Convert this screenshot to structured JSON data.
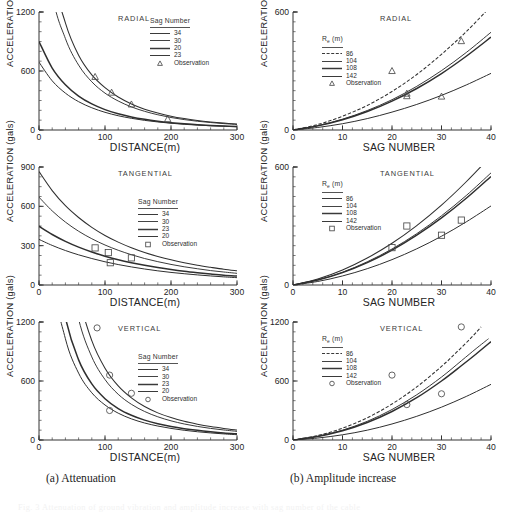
{
  "figure": {
    "subcaption_a": "(a) Attenuation",
    "subcaption_b": "(b) Amplitude increase",
    "ghost_caption": "Fig. 3  Attenuation of ground vibration and amplitude increase with sag number of the cable"
  },
  "axes": {
    "y_title": "ACCELERATION (gals)",
    "x_title_left": "DISTANCE(m)",
    "x_title_right": "SAG NUMBER"
  },
  "legend_labels": {
    "sag_title": "Sag Number",
    "re_title": "R",
    "re_sub": "e",
    "re_unit": " (m)",
    "observation": "Observation"
  },
  "chart_data": [
    {
      "id": "left-radial",
      "type": "line",
      "panel": "RADIAL",
      "column": "(a) Attenuation",
      "title": "RADIAL",
      "xlabel": "DISTANCE(m)",
      "ylabel": "ACCELERATION (gals)",
      "xlim": [
        0,
        300
      ],
      "ylim": [
        0,
        1200
      ],
      "xticks": [
        0,
        100,
        200,
        300
      ],
      "yticks": [
        0,
        600,
        1200
      ],
      "grid": false,
      "legend_title": "Sag Number",
      "legend_position": "top-right",
      "series": [
        {
          "name": "34",
          "x": [
            0,
            20,
            40,
            60,
            80,
            100,
            120,
            140,
            160,
            180,
            200,
            220,
            240,
            260,
            280,
            300
          ],
          "values": [
            3100,
            1660,
            1090,
            760,
            560,
            430,
            335,
            265,
            212,
            172,
            140,
            116,
            97,
            82,
            70,
            60
          ]
        },
        {
          "name": "30",
          "x": [
            0,
            20,
            40,
            60,
            80,
            100,
            120,
            140,
            160,
            180,
            200,
            220,
            240,
            260,
            280,
            300
          ],
          "values": [
            2500,
            1390,
            930,
            660,
            490,
            375,
            295,
            235,
            190,
            155,
            127,
            106,
            89,
            76,
            65,
            56
          ]
        },
        {
          "name": "20",
          "x": [
            0,
            20,
            40,
            60,
            80,
            100,
            120,
            140,
            160,
            180,
            200,
            220,
            240,
            260,
            280,
            300
          ],
          "values": [
            900,
            630,
            460,
            345,
            265,
            207,
            165,
            133,
            109,
            90,
            75,
            63,
            54,
            46,
            40,
            35
          ]
        },
        {
          "name": "23",
          "x": [
            0,
            20,
            40,
            60,
            80,
            100,
            120,
            140,
            160,
            180,
            200,
            220,
            240,
            260,
            280,
            300
          ],
          "values": [
            690,
            500,
            375,
            288,
            226,
            180,
            145,
            119,
            98,
            82,
            69,
            58,
            50,
            43,
            38,
            33
          ]
        }
      ],
      "observations": {
        "name": "Observation",
        "marker": "triangle",
        "points": [
          [
            85,
            540
          ],
          [
            110,
            380
          ],
          [
            140,
            260
          ],
          [
            195,
            110
          ]
        ]
      }
    },
    {
      "id": "left-tangential",
      "type": "line",
      "panel": "TANGENTIAL",
      "column": "(a) Attenuation",
      "title": "TANGENTIAL",
      "xlabel": "DISTANCE(m)",
      "ylabel": "ACCELERATION (gals)",
      "xlim": [
        0,
        300
      ],
      "ylim": [
        0,
        900
      ],
      "xticks": [
        0,
        100,
        200,
        300
      ],
      "yticks": [
        0,
        300,
        600,
        900
      ],
      "grid": false,
      "legend_title": "Sag Number",
      "legend_position": "mid-right",
      "series": [
        {
          "name": "34",
          "x": [
            0,
            20,
            40,
            60,
            80,
            100,
            120,
            140,
            160,
            180,
            200,
            220,
            240,
            260,
            280,
            300
          ],
          "values": [
            865,
            720,
            605,
            515,
            440,
            378,
            327,
            284,
            248,
            218,
            192,
            170,
            151,
            135,
            120,
            108
          ]
        },
        {
          "name": "30",
          "x": [
            0,
            20,
            40,
            60,
            80,
            100,
            120,
            140,
            160,
            180,
            200,
            220,
            240,
            260,
            280,
            300
          ],
          "values": [
            670,
            565,
            480,
            410,
            353,
            305,
            265,
            231,
            202,
            178,
            157,
            139,
            124,
            110,
            99,
            89
          ]
        },
        {
          "name": "23",
          "x": [
            0,
            20,
            40,
            60,
            80,
            100,
            120,
            140,
            160,
            180,
            200,
            220,
            240,
            260,
            280,
            300
          ],
          "values": [
            448,
            385,
            333,
            289,
            252,
            220,
            193,
            170,
            150,
            133,
            118,
            105,
            94,
            84,
            75,
            68
          ]
        },
        {
          "name": "20",
          "x": [
            0,
            20,
            40,
            60,
            80,
            100,
            120,
            140,
            160,
            180,
            200,
            220,
            240,
            260,
            280,
            300
          ],
          "values": [
            348,
            302,
            263,
            230,
            202,
            177,
            156,
            138,
            122,
            108,
            96,
            86,
            77,
            69,
            62,
            56
          ]
        }
      ],
      "observations": {
        "name": "Observation",
        "marker": "square",
        "points": [
          [
            85,
            283
          ],
          [
            105,
            247
          ],
          [
            108,
            170
          ],
          [
            140,
            207
          ]
        ]
      }
    },
    {
      "id": "left-vertical",
      "type": "line",
      "panel": "VERTICAL",
      "column": "(a) Attenuation",
      "title": "VERTICAL",
      "xlabel": "DISTANCE(m)",
      "ylabel": "ACCELERATION (gals)",
      "xlim": [
        0,
        300
      ],
      "ylim": [
        0,
        1200
      ],
      "xticks": [
        0,
        100,
        200,
        300
      ],
      "yticks": [
        0,
        600,
        1200
      ],
      "grid": false,
      "legend_title": "Sag Number",
      "legend_position": "mid-right",
      "series": [
        {
          "name": "34",
          "x": [
            0,
            20,
            40,
            60,
            80,
            100,
            120,
            140,
            160,
            180,
            200,
            220,
            240,
            260,
            280,
            300
          ],
          "values": [
            9000,
            4200,
            2350,
            1480,
            1010,
            730,
            550,
            428,
            340,
            276,
            228,
            190,
            161,
            137,
            118,
            102
          ]
        },
        {
          "name": "30",
          "x": [
            0,
            20,
            40,
            60,
            80,
            100,
            120,
            140,
            160,
            180,
            200,
            220,
            240,
            260,
            280,
            300
          ],
          "values": [
            7200,
            3400,
            1930,
            1230,
            845,
            615,
            465,
            363,
            290,
            236,
            195,
            163,
            138,
            118,
            102,
            88
          ]
        },
        {
          "name": "23",
          "x": [
            0,
            20,
            40,
            60,
            80,
            100,
            120,
            140,
            160,
            180,
            200,
            220,
            240,
            260,
            280,
            300
          ],
          "values": [
            4300,
            2120,
            1250,
            815,
            570,
            420,
            320,
            252,
            202,
            165,
            137,
            115,
            98,
            84,
            72,
            63
          ]
        },
        {
          "name": "20",
          "x": [
            0,
            20,
            40,
            60,
            80,
            100,
            120,
            140,
            160,
            180,
            200,
            220,
            240,
            260,
            280,
            300
          ],
          "values": [
            3400,
            1720,
            1030,
            680,
            480,
            356,
            273,
            215,
            173,
            142,
            118,
            99,
            84,
            72,
            62,
            54
          ]
        }
      ],
      "observations": {
        "name": "Observation",
        "marker": "circle",
        "points": [
          [
            88,
            1140
          ],
          [
            107,
            660
          ],
          [
            107,
            300
          ],
          [
            140,
            475
          ]
        ]
      }
    },
    {
      "id": "right-radial",
      "type": "line",
      "panel": "RADIAL",
      "column": "(b) Amplitude increase",
      "title": "RADIAL",
      "xlabel": "SAG NUMBER",
      "ylabel": "ACCELERATION (gals)",
      "xlim": [
        0,
        40
      ],
      "ylim": [
        0,
        600
      ],
      "xticks": [
        0,
        10,
        20,
        30,
        40
      ],
      "yticks": [
        0,
        600
      ],
      "grid": false,
      "legend_title": "Re (m)",
      "legend_position": "upper-left",
      "series": [
        {
          "name": "86",
          "dash": true,
          "x": [
            0,
            5,
            10,
            15,
            20,
            25,
            30,
            35,
            40
          ],
          "values": [
            0,
            28,
            70,
            125,
            196,
            282,
            385,
            500,
            630
          ]
        },
        {
          "name": "104",
          "x": [
            0,
            5,
            10,
            15,
            20,
            25,
            30,
            35,
            40
          ],
          "values": [
            0,
            22,
            55,
            99,
            154,
            222,
            302,
            394,
            497
          ]
        },
        {
          "name": "108",
          "x": [
            0,
            5,
            10,
            15,
            20,
            25,
            30,
            35,
            40
          ],
          "values": [
            0,
            21,
            52,
            94,
            147,
            211,
            287,
            375,
            472
          ]
        },
        {
          "name": "142",
          "x": [
            0,
            5,
            10,
            15,
            20,
            25,
            30,
            35,
            40
          ],
          "values": [
            0,
            13,
            32,
            58,
            91,
            130,
            176,
            229,
            288
          ]
        }
      ],
      "observations": {
        "name": "Observation",
        "marker": "triangle",
        "points": [
          [
            20,
            300
          ],
          [
            23,
            185
          ],
          [
            23,
            172
          ],
          [
            30,
            170
          ],
          [
            34,
            452
          ]
        ]
      }
    },
    {
      "id": "right-tangential",
      "type": "line",
      "panel": "TANGENTIAL",
      "column": "(b) Amplitude increase",
      "title": "TANGENTIAL",
      "xlabel": "SAG NUMBER",
      "ylabel": "ACCELERATION (gals)",
      "xlim": [
        0,
        40
      ],
      "ylim": [
        0,
        600
      ],
      "xticks": [
        0,
        10,
        20,
        30,
        40
      ],
      "yticks": [
        0,
        600
      ],
      "grid": false,
      "legend_title": "Re (m)",
      "legend_position": "upper-left",
      "series": [
        {
          "name": "86",
          "x": [
            0,
            5,
            10,
            15,
            20,
            25,
            30,
            35,
            40
          ],
          "values": [
            0,
            30,
            76,
            137,
            212,
            302,
            406,
            525,
            656
          ]
        },
        {
          "name": "104",
          "x": [
            0,
            5,
            10,
            15,
            20,
            25,
            30,
            35,
            40
          ],
          "values": [
            0,
            26,
            65,
            118,
            183,
            261,
            352,
            455,
            570
          ]
        },
        {
          "name": "108",
          "x": [
            0,
            5,
            10,
            15,
            20,
            25,
            30,
            35,
            40
          ],
          "values": [
            0,
            25,
            63,
            114,
            177,
            253,
            341,
            441,
            552
          ]
        },
        {
          "name": "142",
          "x": [
            0,
            5,
            10,
            15,
            20,
            25,
            30,
            35,
            40
          ],
          "values": [
            0,
            18,
            46,
            83,
            129,
            184,
            248,
            321,
            402
          ]
        }
      ],
      "observations": {
        "name": "Observation",
        "marker": "square",
        "points": [
          [
            20,
            190
          ],
          [
            23,
            300
          ],
          [
            30,
            253
          ],
          [
            34,
            330
          ]
        ]
      }
    },
    {
      "id": "right-vertical",
      "type": "line",
      "panel": "VERTICAL",
      "column": "(b) Amplitude increase",
      "title": "VERTICAL",
      "xlabel": "SAG NUMBER",
      "ylabel": "ACCELERATION (gals)",
      "xlim": [
        0,
        40
      ],
      "ylim": [
        0,
        1200
      ],
      "xticks": [
        0,
        10,
        20,
        30,
        40
      ],
      "yticks": [
        0,
        600,
        1200
      ],
      "grid": false,
      "legend_title": "Re (m)",
      "legend_position": "upper-left",
      "series": [
        {
          "name": "86",
          "dash": true,
          "x": [
            0,
            5,
            10,
            15,
            20,
            25,
            30,
            33,
            36,
            38
          ],
          "values": [
            0,
            46,
            120,
            226,
            366,
            540,
            748,
            890,
            1040,
            1150
          ]
        },
        {
          "name": "104",
          "x": [
            0,
            5,
            10,
            15,
            20,
            25,
            30,
            34,
            37,
            39.5
          ],
          "values": [
            0,
            38,
            100,
            190,
            310,
            460,
            640,
            805,
            930,
            1030
          ]
        },
        {
          "name": "108",
          "x": [
            0,
            5,
            10,
            15,
            20,
            25,
            30,
            34,
            37,
            40
          ],
          "values": [
            0,
            36,
            94,
            178,
            290,
            430,
            600,
            755,
            875,
            1000
          ]
        },
        {
          "name": "142",
          "x": [
            0,
            5,
            10,
            15,
            20,
            25,
            30,
            35,
            40
          ],
          "values": [
            0,
            20,
            53,
            100,
            163,
            241,
            334,
            443,
            566
          ]
        }
      ],
      "observations": {
        "name": "Observation",
        "marker": "circle",
        "points": [
          [
            20,
            660
          ],
          [
            23,
            360
          ],
          [
            30,
            470
          ],
          [
            34,
            1150
          ]
        ]
      }
    }
  ]
}
